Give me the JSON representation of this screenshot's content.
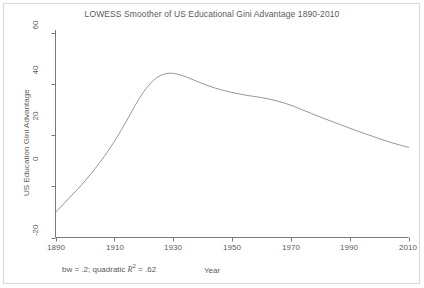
{
  "chart_data": {
    "type": "line",
    "title": "LOWESS Smoother of US Educational Gini Advantage 1890-2010",
    "xlabel": "Year",
    "ylabel": "US Education Gini Advantage",
    "xlim": [
      1890,
      2010
    ],
    "ylim": [
      -20,
      60
    ],
    "x_ticks": [
      1890,
      1910,
      1930,
      1950,
      1970,
      1990,
      2010
    ],
    "y_ticks": [
      -20,
      0,
      20,
      40,
      60
    ],
    "grid": false,
    "legend": null,
    "annotation": "bw = .2; quadratic  R² = .62",
    "annotation_parts": {
      "prefix": "bw = .2; quadratic",
      "stat_symbol": "R",
      "stat_exponent": "2",
      "stat_equals": "=",
      "stat_value": ".62"
    },
    "series": [
      {
        "name": "LOWESS smoother",
        "x": [
          1890,
          1893,
          1896,
          1899,
          1902,
          1905,
          1908,
          1911,
          1914,
          1917,
          1920,
          1923,
          1926,
          1929,
          1932,
          1935,
          1938,
          1941,
          1944,
          1947,
          1950,
          1953,
          1956,
          1959,
          1962,
          1965,
          1968,
          1971,
          1974,
          1977,
          1980,
          1983,
          1986,
          1989,
          1992,
          1995,
          1998,
          2001,
          2004,
          2007,
          2010
        ],
        "y": [
          -10.2,
          -6.6,
          -3.0,
          0.7,
          4.8,
          9.2,
          14.0,
          19.3,
          25.2,
          31.4,
          36.9,
          41.0,
          43.4,
          44.1,
          43.6,
          42.4,
          41.0,
          39.6,
          38.4,
          37.4,
          36.6,
          35.9,
          35.3,
          34.8,
          34.2,
          33.4,
          32.4,
          31.2,
          29.8,
          28.4,
          27.0,
          25.7,
          24.4,
          23.1,
          21.8,
          20.6,
          19.4,
          18.2,
          17.1,
          16.1,
          15.2
        ]
      }
    ]
  },
  "axes": {
    "y_tick_labels": [
      "60",
      "40",
      "20",
      "0",
      "-20"
    ],
    "x_tick_labels": [
      "1890",
      "1910",
      "1930",
      "1950",
      "1970",
      "1990",
      "2010"
    ]
  },
  "colors": {
    "line": "#8a8a8a",
    "axis": "#7a7a7a",
    "text": "#5a5a5a",
    "background": "#ffffff",
    "frame": "#d9d9d9"
  }
}
